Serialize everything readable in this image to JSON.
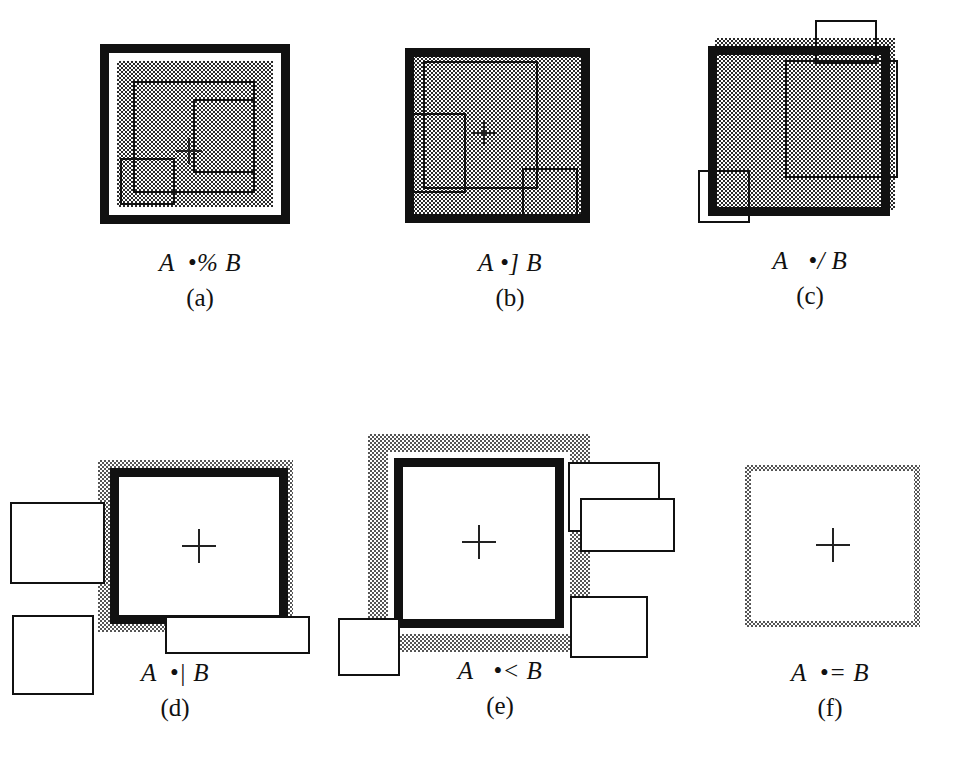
{
  "figure": {
    "kind": "spatial-relation-diagram-grid",
    "background_color": "#ffffff",
    "ink_color": "#111111",
    "fill_pattern": "50% checkerboard dither (gray)",
    "rows": 2,
    "columns": 3,
    "panel_count": 6
  },
  "panels": [
    {
      "id": "a",
      "index_label": "(a)",
      "expression": "A  •% B",
      "operator_symbol": "•%",
      "operand_left": "A",
      "operand_right": "B",
      "description": "Thick black outer frame, white gap ring, dithered gray interior with two thin rectangles and a centroid cross",
      "has_cross_marker": true
    },
    {
      "id": "b",
      "index_label": "(b)",
      "expression": "A •] B",
      "operator_symbol": "•]",
      "operand_left": "A",
      "operand_right": "B",
      "description": "Thick black frame directly enclosing dithered gray fill; thin rectangles inside touching the frame",
      "has_cross_marker": true
    },
    {
      "id": "c",
      "index_label": "(c)",
      "expression": "A   •/ B",
      "operator_symbol": "•/",
      "operand_left": "A",
      "operand_right": "B",
      "description": "Dithered gray square with a thick black frame offset up and left; thin rectangles crossing the top and bottom-left edges",
      "has_cross_marker": false
    },
    {
      "id": "d",
      "index_label": "(d)",
      "expression": "A  •| B",
      "operator_symbol": "•|",
      "operand_left": "A",
      "operand_right": "B",
      "description": "White square with thick black border wrapped in a narrow dithered gray band; thin rectangles at left and bottom",
      "has_cross_marker": true
    },
    {
      "id": "e",
      "index_label": "(e)",
      "expression": "A   •< B",
      "operator_symbol": "•<",
      "operand_left": "A",
      "operand_right": "B",
      "description": "White square with thick black border, white gap, and a wide dithered gray band; thin rectangles stacked at right and one at bottom-left",
      "has_cross_marker": true
    },
    {
      "id": "f",
      "index_label": "(f)",
      "expression": "A  •= B",
      "operator_symbol": "•=",
      "operand_left": "A",
      "operand_right": "B",
      "description": "Plain square outlined with a thin dithered gray border and a centroid cross",
      "has_cross_marker": true
    }
  ]
}
